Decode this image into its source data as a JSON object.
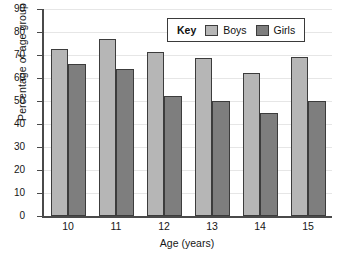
{
  "chart_data": {
    "type": "bar",
    "title": "",
    "xlabel": "Age (years)",
    "ylabel": "Percentage of age group",
    "categories": [
      "10",
      "11",
      "12",
      "13",
      "14",
      "15"
    ],
    "series": [
      {
        "name": "Boys",
        "color": "#b6b6b6",
        "values": [
          72.5,
          77,
          71.5,
          68.5,
          62,
          69
        ]
      },
      {
        "name": "Girls",
        "color": "#7e7e7e",
        "values": [
          66,
          64,
          52,
          50,
          45,
          50
        ]
      }
    ],
    "ylim": [
      0,
      90
    ],
    "ytick_values": [
      0,
      10,
      20,
      30,
      40,
      50,
      60,
      70,
      80,
      90
    ],
    "ytick_labels": [
      "0",
      "10",
      "20",
      "30",
      "40",
      "50",
      "60",
      "70",
      "80",
      "90"
    ],
    "grid": true,
    "legend_position": "top-right"
  },
  "legend": {
    "title": "Key",
    "entries": [
      {
        "label": "Boys"
      },
      {
        "label": "Girls"
      }
    ]
  }
}
